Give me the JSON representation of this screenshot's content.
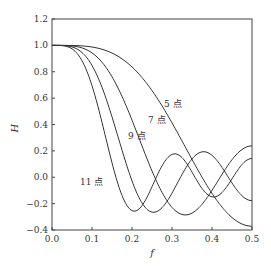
{
  "chart_data": {
    "type": "line",
    "title": "",
    "xlabel": "f",
    "ylabel": "H",
    "xlim": [
      0.0,
      0.5
    ],
    "ylim": [
      -0.4,
      1.2
    ],
    "xticks": [
      "0.0",
      "0.1",
      "0.2",
      "0.3",
      "0.4",
      "0.5"
    ],
    "yticks": [
      "1.2",
      "1.0",
      "0.8",
      "0.6",
      "0.4",
      "0.2",
      "0.0",
      "-0.2",
      "-0.4"
    ],
    "grid": false,
    "legend": "inline labels",
    "series": [
      {
        "name": "5 点",
        "label_pos": [
          0.28,
          0.53
        ],
        "coefficients": [
          -3,
          12,
          17,
          12,
          -3
        ],
        "norm": 35
      },
      {
        "name": "7 点",
        "label_pos": [
          0.24,
          0.41
        ],
        "coefficients": [
          -2,
          3,
          6,
          7,
          6,
          3,
          -2
        ],
        "norm": 21
      },
      {
        "name": "9 点",
        "label_pos": [
          0.19,
          0.29
        ],
        "coefficients": [
          -21,
          14,
          39,
          54,
          59,
          54,
          39,
          14,
          -21
        ],
        "norm": 231
      },
      {
        "name": "11 点",
        "label_pos": [
          0.07,
          -0.06
        ],
        "coefficients": [
          -36,
          9,
          44,
          69,
          84,
          89,
          84,
          69,
          44,
          9,
          -36
        ],
        "norm": 429
      }
    ],
    "sample_points": {
      "f": [
        0.0,
        0.05,
        0.1,
        0.15,
        0.2,
        0.25,
        0.3,
        0.35,
        0.4,
        0.45,
        0.5
      ],
      "5 点": [
        1.0,
        0.998,
        0.969,
        0.864,
        0.669,
        0.457,
        0.247,
        0.069,
        -0.066,
        -0.142,
        -0.165
      ],
      "7 点": [
        1.0,
        0.987,
        0.858,
        0.573,
        0.233,
        -0.021,
        -0.119,
        -0.067,
        0.051,
        0.151,
        0.191
      ],
      "9 点": [
        1.0,
        0.96,
        0.682,
        0.257,
        -0.087,
        -0.2,
        -0.075,
        0.103,
        0.17,
        0.085,
        -0.039
      ],
      "11 点": [
        1.0,
        0.911,
        0.478,
        -0.016,
        -0.227,
        -0.093,
        0.116,
        0.138,
        -0.034,
        -0.148,
        -0.2
      ]
    }
  }
}
